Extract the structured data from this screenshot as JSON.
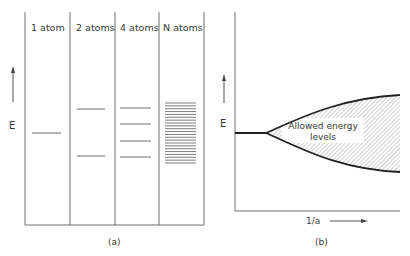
{
  "panel_a": {
    "caption": "(a)",
    "axis_label": "E",
    "columns": [
      {
        "label": "1 atom",
        "levels": [
          133
        ]
      },
      {
        "label": "2 atoms",
        "levels": [
          109,
          156
        ]
      },
      {
        "label": "4 atoms",
        "levels": [
          108,
          124,
          141,
          157
        ]
      },
      {
        "label": "N atoms",
        "band": {
          "top": 103,
          "bottom": 163,
          "lines": 22
        }
      }
    ]
  },
  "panel_b": {
    "caption": "(b)",
    "y_label": "E",
    "x_label": "1/a",
    "region_label_line1": "Allowed energy",
    "region_label_line2": "levels"
  },
  "colors": {
    "line": "#6e6e6e",
    "curve": "#222222",
    "hatch": "#8a8a8a"
  }
}
